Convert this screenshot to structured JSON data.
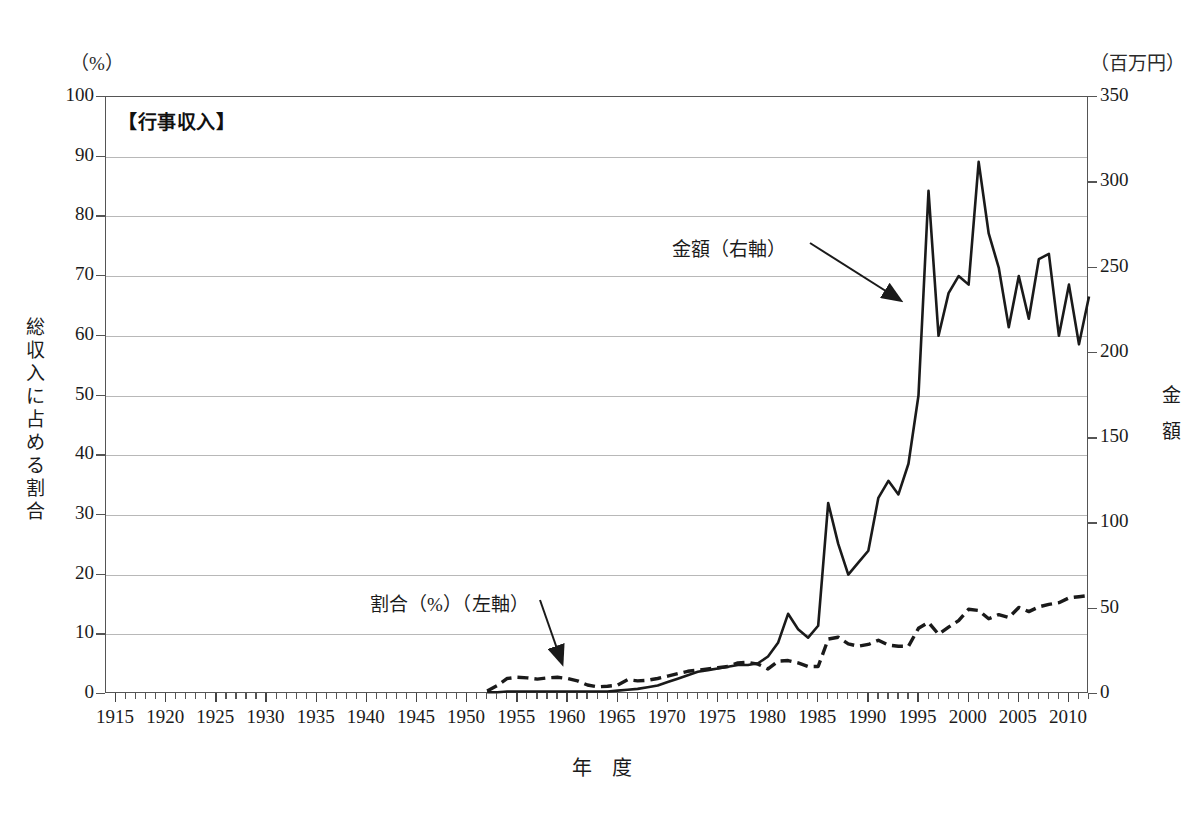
{
  "units": {
    "left": "（%）",
    "right": "（百万円）"
  },
  "axis_titles": {
    "x": "年　度",
    "y_left": "総収入に占める割合",
    "y_right": "金額"
  },
  "annotations": {
    "amount": "金額（右軸）",
    "ratio": "割合（%）（左軸）"
  },
  "chart_data": {
    "type": "line",
    "title": "【行事収入】",
    "xlabel": "年　度",
    "ylabel": "総収入に占める割合",
    "ylabel_right": "金額",
    "unit_left": "（%）",
    "unit_right": "（百万円）",
    "xlim": [
      1914,
      2012
    ],
    "ylim_left": [
      0,
      100
    ],
    "ylim_right": [
      0,
      350
    ],
    "ytick_left": [
      0,
      10,
      20,
      30,
      40,
      50,
      60,
      70,
      80,
      90,
      100
    ],
    "ytick_right": [
      0,
      50,
      100,
      150,
      200,
      250,
      300,
      350
    ],
    "xticks_major": [
      1915,
      1920,
      1925,
      1930,
      1935,
      1940,
      1945,
      1950,
      1955,
      1960,
      1965,
      1970,
      1975,
      1980,
      1985,
      1990,
      1995,
      2000,
      2005,
      2010
    ],
    "xtick_minor_step": 1,
    "grid": "horizontal",
    "legend_position": "inline-annotations",
    "series": [
      {
        "name": "金額（右軸）",
        "axis": "right",
        "style": "solid",
        "color": "#1a1a1a",
        "x": [
          1952,
          1953,
          1954,
          1955,
          1956,
          1957,
          1958,
          1959,
          1960,
          1961,
          1962,
          1963,
          1964,
          1965,
          1966,
          1967,
          1968,
          1969,
          1970,
          1971,
          1972,
          1973,
          1974,
          1975,
          1976,
          1977,
          1978,
          1979,
          1980,
          1981,
          1982,
          1983,
          1984,
          1985,
          1986,
          1987,
          1988,
          1989,
          1990,
          1991,
          1992,
          1993,
          1994,
          1995,
          1996,
          1997,
          1998,
          1999,
          2000,
          2001,
          2002,
          2003,
          2004,
          2005,
          2006,
          2007,
          2008,
          2009,
          2010,
          2011,
          2012
        ],
        "y": [
          1,
          1,
          1.5,
          1.5,
          1.5,
          1.5,
          1.5,
          1.5,
          1.5,
          1.5,
          1.5,
          1.5,
          1.5,
          2,
          2.5,
          3,
          4,
          5,
          7,
          9,
          11,
          13,
          14,
          15,
          16,
          17,
          17,
          18,
          22,
          30,
          47,
          38,
          33,
          40,
          112,
          88,
          70,
          77,
          84,
          115,
          125,
          117,
          135,
          175,
          295,
          210,
          235,
          245,
          240,
          312,
          270,
          250,
          215,
          245,
          220,
          255,
          258,
          210,
          240,
          205,
          233
        ]
      },
      {
        "name": "割合（%）（左軸）",
        "axis": "left",
        "style": "dashed",
        "color": "#1a1a1a",
        "x": [
          1952,
          1953,
          1954,
          1955,
          1956,
          1957,
          1958,
          1959,
          1960,
          1961,
          1962,
          1963,
          1964,
          1965,
          1966,
          1967,
          1968,
          1969,
          1970,
          1971,
          1972,
          1973,
          1974,
          1975,
          1976,
          1977,
          1978,
          1979,
          1980,
          1981,
          1982,
          1983,
          1984,
          1985,
          1986,
          1987,
          1988,
          1989,
          1990,
          1991,
          1992,
          1993,
          1994,
          1995,
          1996,
          1997,
          1998,
          1999,
          2000,
          2001,
          2002,
          2003,
          2004,
          2005,
          2006,
          2007,
          2008,
          2009,
          2010,
          2011,
          2012
        ],
        "y": [
          0.5,
          1.4,
          2.6,
          2.8,
          2.7,
          2.5,
          2.7,
          2.8,
          2.6,
          2.2,
          1.5,
          1.2,
          1.3,
          1.5,
          2.4,
          2.2,
          2.3,
          2.6,
          3.0,
          3.4,
          3.8,
          4.0,
          4.2,
          4.4,
          4.6,
          5.2,
          5.3,
          5.0,
          4.2,
          5.5,
          5.6,
          5.2,
          4.6,
          4.6,
          9.2,
          9.5,
          8.4,
          8.0,
          8.3,
          9.0,
          8.2,
          8.0,
          8.0,
          11.0,
          12.0,
          10.0,
          11.2,
          12.3,
          14.2,
          14.0,
          12.6,
          13.3,
          12.8,
          14.5,
          13.8,
          14.6,
          15.0,
          15.3,
          16.1,
          16.3,
          16.5
        ]
      }
    ]
  }
}
